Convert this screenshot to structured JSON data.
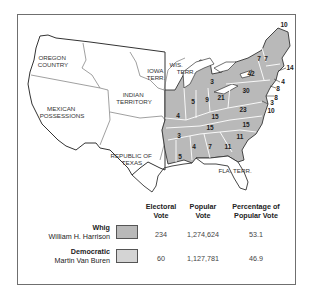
{
  "colors": {
    "whig": "#b9b9b9",
    "democratic": "#d4d4d4",
    "territory": "#ffffff",
    "state_border": "#ffffff",
    "outline": "#333333"
  },
  "territories": [
    {
      "label_lines": [
        "OREGON",
        "COUNTRY"
      ]
    },
    {
      "label_lines": [
        "MEXICAN",
        "POSSESSIONS"
      ]
    },
    {
      "label_lines": [
        "INDIAN",
        "TERRITORY"
      ]
    },
    {
      "label_lines": [
        "IOWA",
        "TERR."
      ]
    },
    {
      "label_lines": [
        "WIS.",
        "TERR."
      ]
    },
    {
      "label_lines": [
        "REPUBLIC OF",
        "TEXAS"
      ]
    },
    {
      "label_lines": [
        "FLA. TERR."
      ]
    }
  ],
  "states": [
    {
      "abbr": "ME",
      "electoral_votes": 10
    },
    {
      "abbr": "NH",
      "electoral_votes": 7
    },
    {
      "abbr": "VT",
      "electoral_votes": 7
    },
    {
      "abbr": "MA",
      "electoral_votes": 14
    },
    {
      "abbr": "RI",
      "electoral_votes": 4
    },
    {
      "abbr": "CT",
      "electoral_votes": 8
    },
    {
      "abbr": "NY",
      "electoral_votes": 42
    },
    {
      "abbr": "NJ",
      "electoral_votes": 8
    },
    {
      "abbr": "PA",
      "electoral_votes": 30
    },
    {
      "abbr": "DE",
      "electoral_votes": 3
    },
    {
      "abbr": "MD",
      "electoral_votes": 10
    },
    {
      "abbr": "VA",
      "electoral_votes": 23
    },
    {
      "abbr": "NC",
      "electoral_votes": 15
    },
    {
      "abbr": "SC",
      "electoral_votes": 11
    },
    {
      "abbr": "GA",
      "electoral_votes": 11
    },
    {
      "abbr": "AL",
      "electoral_votes": 7
    },
    {
      "abbr": "MS",
      "electoral_votes": 4
    },
    {
      "abbr": "LA",
      "electoral_votes": 5
    },
    {
      "abbr": "AR",
      "electoral_votes": 3
    },
    {
      "abbr": "TN",
      "electoral_votes": 15
    },
    {
      "abbr": "KY",
      "electoral_votes": 15
    },
    {
      "abbr": "OH",
      "electoral_votes": 21
    },
    {
      "abbr": "IN",
      "electoral_votes": 9
    },
    {
      "abbr": "IL",
      "electoral_votes": 5
    },
    {
      "abbr": "MO",
      "electoral_votes": 4
    },
    {
      "abbr": "MI",
      "electoral_votes": 3
    }
  ],
  "legend": {
    "headers": {
      "electoral": [
        "Electoral",
        "Vote"
      ],
      "popular": [
        "Popular",
        "Vote"
      ],
      "percentage": [
        "Percentage of",
        "Popular Vote"
      ]
    },
    "rows": [
      {
        "party": "Whig",
        "candidate": "William H. Harrison",
        "electoral_vote": "234",
        "popular_vote": "1,274,624",
        "percentage": "53.1"
      },
      {
        "party": "Democratic",
        "candidate": "Martin Van Buren",
        "electoral_vote": "60",
        "popular_vote": "1,127,781",
        "percentage": "46.9"
      }
    ]
  }
}
